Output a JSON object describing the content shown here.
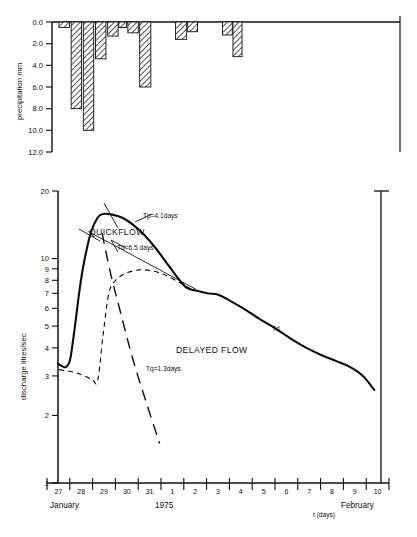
{
  "figure": {
    "title": "",
    "background": "#ffffff",
    "ink_color": "#101010"
  },
  "precip_panel": {
    "ylabel": "precipitation mm",
    "yticks": [
      "0.0",
      "2.0",
      "4.0",
      "6.0",
      "8.0",
      "10.0",
      "12.0"
    ],
    "ytick_values": [
      0,
      2,
      4,
      6,
      8,
      10,
      12
    ],
    "ylim": [
      0,
      12
    ],
    "direction": "inverted"
  },
  "discharge_panel": {
    "ylabel": "discharge litres/sec",
    "yticks": [
      "20",
      "10",
      "9",
      "8",
      "7",
      "6",
      "5",
      "4",
      "3",
      "2",
      "1"
    ],
    "ytick_values": [
      20,
      10,
      9,
      8,
      7,
      6,
      5,
      4,
      3,
      2,
      1
    ],
    "ylim": [
      1,
      20
    ],
    "yscale": "log"
  },
  "xaxis": {
    "label": "t (days)",
    "ticklabels": [
      "27",
      "28",
      "29",
      "30",
      "31",
      "1",
      "2",
      "3",
      "4",
      "5",
      "6",
      "7",
      "8",
      "9",
      "10"
    ],
    "month_left": "January",
    "year": "1975",
    "month_right": "February"
  },
  "annotations": {
    "quickflow": "QUICKFLOW",
    "delayed_flow": "DELAYED FLOW",
    "tp": "Tp=4.1days",
    "td_label": "Td=6.5 days",
    "tq": "Tq=1.3days",
    "td_curve": "Td"
  },
  "chart_data": {
    "type": "line",
    "title": "",
    "xlabel": "t (days)",
    "ylabel": "discharge litres/sec",
    "panels": [
      {
        "name": "precipitation",
        "type": "bar",
        "ylabel": "precipitation mm",
        "ylim": [
          0,
          12
        ],
        "inverted_y": true,
        "grid": false,
        "bars": [
          {
            "day": "27",
            "x_frac": 0.02,
            "width_frac": 0.03,
            "value": 0.5
          },
          {
            "day": "27",
            "x_frac": 0.055,
            "width_frac": 0.03,
            "value": 8.0
          },
          {
            "day": "28",
            "x_frac": 0.09,
            "width_frac": 0.03,
            "value": 10.0
          },
          {
            "day": "28",
            "x_frac": 0.125,
            "width_frac": 0.03,
            "value": 3.4
          },
          {
            "day": "29",
            "x_frac": 0.16,
            "width_frac": 0.03,
            "value": 1.3
          },
          {
            "day": "29",
            "x_frac": 0.192,
            "width_frac": 0.022,
            "value": 0.5
          },
          {
            "day": "29",
            "x_frac": 0.218,
            "width_frac": 0.03,
            "value": 1.0
          },
          {
            "day": "30",
            "x_frac": 0.252,
            "width_frac": 0.032,
            "value": 6.0
          },
          {
            "day": "31",
            "x_frac": 0.355,
            "width_frac": 0.032,
            "value": 1.6
          },
          {
            "day": "31",
            "x_frac": 0.39,
            "width_frac": 0.028,
            "value": 0.9
          },
          {
            "day": "1",
            "x_frac": 0.49,
            "width_frac": 0.028,
            "value": 1.2
          },
          {
            "day": "1",
            "x_frac": 0.52,
            "width_frac": 0.026,
            "value": 3.2
          }
        ]
      },
      {
        "name": "discharge",
        "type": "line",
        "ylabel": "discharge litres/sec",
        "yscale": "log",
        "ylim": [
          1,
          20
        ],
        "grid": false,
        "series": [
          {
            "name": "total streamflow",
            "style": "solid-thick",
            "points": [
              {
                "t": 0.0,
                "q": 3.4
              },
              {
                "t": 0.22,
                "q": 3.3
              },
              {
                "t": 0.38,
                "q": 3.3
              },
              {
                "t": 0.55,
                "q": 3.6
              },
              {
                "t": 0.75,
                "q": 5.0
              },
              {
                "t": 0.95,
                "q": 7.2
              },
              {
                "t": 1.15,
                "q": 9.6
              },
              {
                "t": 1.45,
                "q": 13.0
              },
              {
                "t": 1.75,
                "q": 15.2
              },
              {
                "t": 2.0,
                "q": 15.8
              },
              {
                "t": 2.4,
                "q": 15.7
              },
              {
                "t": 2.85,
                "q": 15.2
              },
              {
                "t": 3.3,
                "q": 14.2
              },
              {
                "t": 3.8,
                "q": 12.8
              },
              {
                "t": 4.3,
                "q": 11.2
              },
              {
                "t": 4.8,
                "q": 9.6
              },
              {
                "t": 5.3,
                "q": 8.2
              },
              {
                "t": 5.7,
                "q": 7.4
              },
              {
                "t": 6.1,
                "q": 7.2
              },
              {
                "t": 6.6,
                "q": 7.0
              },
              {
                "t": 7.1,
                "q": 6.9
              },
              {
                "t": 7.6,
                "q": 6.5
              },
              {
                "t": 8.2,
                "q": 6.0
              },
              {
                "t": 8.9,
                "q": 5.4
              },
              {
                "t": 9.6,
                "q": 4.9
              },
              {
                "t": 10.3,
                "q": 4.4
              },
              {
                "t": 11.0,
                "q": 4.0
              },
              {
                "t": 11.7,
                "q": 3.7
              },
              {
                "t": 12.3,
                "q": 3.5
              },
              {
                "t": 12.9,
                "q": 3.3
              },
              {
                "t": 13.5,
                "q": 3.0
              },
              {
                "t": 14.0,
                "q": 2.6
              }
            ]
          },
          {
            "name": "delayed flow (separation)",
            "style": "dashed-short",
            "points": [
              {
                "t": 0.05,
                "q": 3.2
              },
              {
                "t": 0.8,
                "q": 3.1
              },
              {
                "t": 1.5,
                "q": 2.9
              },
              {
                "t": 1.75,
                "q": 2.85
              },
              {
                "t": 2.0,
                "q": 4.6
              },
              {
                "t": 2.25,
                "q": 7.0
              },
              {
                "t": 2.55,
                "q": 8.0
              },
              {
                "t": 3.0,
                "q": 8.6
              },
              {
                "t": 3.6,
                "q": 8.9
              },
              {
                "t": 4.2,
                "q": 8.8
              },
              {
                "t": 4.8,
                "q": 8.4
              },
              {
                "t": 5.4,
                "q": 7.8
              },
              {
                "t": 5.8,
                "q": 7.4
              },
              {
                "t": 6.1,
                "q": 7.2
              }
            ]
          },
          {
            "name": "quickflow recession",
            "style": "dashed-long",
            "points": [
              {
                "t": 1.95,
                "q": 13.0
              },
              {
                "t": 2.35,
                "q": 8.4
              },
              {
                "t": 2.8,
                "q": 5.6
              },
              {
                "t": 3.3,
                "q": 3.6
              },
              {
                "t": 3.9,
                "q": 2.3
              },
              {
                "t": 4.5,
                "q": 1.5
              }
            ]
          },
          {
            "name": "Td recession line",
            "style": "thin-straight",
            "points": [
              {
                "t": 1.35,
                "q": 13.2
              },
              {
                "t": 6.1,
                "q": 7.3
              }
            ]
          }
        ],
        "annotations": [
          {
            "text": "QUICKFLOW",
            "t": 2.2,
            "q": 12.2
          },
          {
            "text": "DELAYED FLOW",
            "t": 5.6,
            "q": 4.7
          },
          {
            "text": "Tp=4.1days",
            "t": 3.6,
            "q": 14.0
          },
          {
            "text": "Td=6.5 days",
            "t": 2.9,
            "q": 10.6
          },
          {
            "text": "Tq=1.3days",
            "t": 3.4,
            "q": 3.2
          },
          {
            "text": "Td",
            "t": 9.9,
            "q": 5.2
          }
        ]
      }
    ]
  }
}
